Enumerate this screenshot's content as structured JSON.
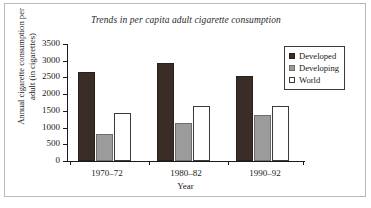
{
  "chart_data": {
    "type": "bar",
    "title": "Trends in per capita adult cigarette consumption",
    "xlabel": "Year",
    "ylabel_line1": "Annual cigarette consumption per",
    "ylabel_line2": "adult (in cigarettes)",
    "categories": [
      "1970–72",
      "1980–82",
      "1990–92"
    ],
    "series": [
      {
        "name": "Developed",
        "values": [
          2650,
          2920,
          2550
        ],
        "color": "#3a2d28"
      },
      {
        "name": "Developing",
        "values": [
          800,
          1150,
          1370
        ],
        "color": "#9b9b9b"
      },
      {
        "name": "World",
        "values": [
          1450,
          1650,
          1650
        ],
        "color": "#ffffff"
      }
    ],
    "ylim": [
      0,
      3500
    ],
    "yticks": [
      0,
      500,
      1000,
      1500,
      2000,
      2500,
      3000,
      3500
    ],
    "ytick_labels": [
      "0",
      "500",
      "1000",
      "1500",
      "2000",
      "2500",
      "3000",
      "3500"
    ],
    "grid": false,
    "legend_position": "right"
  },
  "legend": {
    "items": [
      {
        "label": "Developed",
        "swatch": "developed"
      },
      {
        "label": "Developing",
        "swatch": "developing"
      },
      {
        "label": "World",
        "swatch": "world"
      }
    ]
  }
}
